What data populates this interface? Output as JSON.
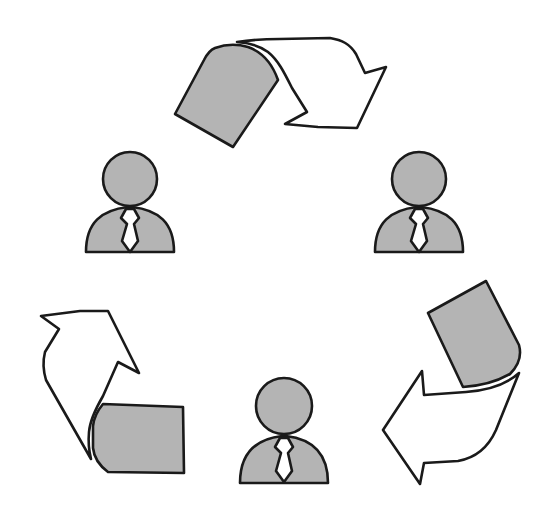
{
  "diagram": {
    "type": "cycle",
    "colors": {
      "fill_gray": "#b4b4b4",
      "outline": "#1a1a1a",
      "background": "#ffffff",
      "arrow_fill": "#ffffff"
    },
    "nodes": [
      {
        "id": "person-left",
        "icon": "person-with-tie-icon",
        "position": "top-left"
      },
      {
        "id": "person-right",
        "icon": "person-with-tie-icon",
        "position": "top-right"
      },
      {
        "id": "person-bottom",
        "icon": "person-with-tie-icon",
        "position": "bottom-center"
      }
    ],
    "edges": [
      {
        "from": "person-left",
        "to": "person-right",
        "icon": "document-arrow-icon",
        "position": "top"
      },
      {
        "from": "person-right",
        "to": "person-bottom",
        "icon": "document-arrow-icon",
        "position": "bottom-right"
      },
      {
        "from": "person-bottom",
        "to": "person-left",
        "icon": "document-arrow-icon",
        "position": "bottom-left"
      }
    ]
  }
}
